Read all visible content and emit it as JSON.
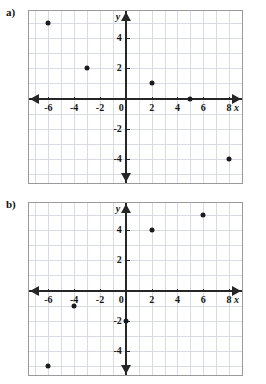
{
  "page": {
    "background_color": "#ffffff",
    "grid_color": "#d9dbe4",
    "axis_color": "#262626",
    "point_color": "#1b1b1b",
    "frame_color": "#9a9a9a"
  },
  "panels": [
    {
      "id": "a",
      "label": "a)",
      "axis_letter_x": "x",
      "axis_letter_y": "y",
      "x_tick_labels": [
        "-6",
        "-4",
        "-2",
        "0",
        "2",
        "4",
        "6",
        "8"
      ],
      "y_tick_labels": [
        "4",
        "2",
        "-2",
        "-4"
      ]
    },
    {
      "id": "b",
      "label": "b)",
      "axis_letter_x": "x",
      "axis_letter_y": "y",
      "x_tick_labels": [
        "-6",
        "-4",
        "-2",
        "0",
        "2",
        "4",
        "6",
        "8"
      ],
      "y_tick_labels": [
        "6",
        "4",
        "2",
        "-2",
        "-4"
      ]
    }
  ],
  "chart_data": [
    {
      "type": "scatter",
      "title": "a)",
      "xlabel": "x",
      "ylabel": "y",
      "xlim": [
        -7.5,
        9
      ],
      "ylim": [
        -5.6,
        5.8
      ],
      "xticks": [
        -6,
        -4,
        -2,
        0,
        2,
        4,
        6,
        8
      ],
      "yticks": [
        4,
        2,
        0,
        -2,
        -4
      ],
      "grid": true,
      "grid_step": 1,
      "legend": "none",
      "points": [
        {
          "x": -6,
          "y": 5
        },
        {
          "x": -3,
          "y": 2
        },
        {
          "x": 2,
          "y": 1
        },
        {
          "x": 5,
          "y": 0
        },
        {
          "x": 8,
          "y": -4
        }
      ]
    },
    {
      "type": "scatter",
      "title": "b)",
      "xlabel": "x",
      "ylabel": "y",
      "xlim": [
        -7.5,
        9
      ],
      "ylim": [
        -5.6,
        5.8
      ],
      "xticks": [
        -6,
        -4,
        -2,
        0,
        2,
        4,
        6,
        8
      ],
      "yticks": [
        6,
        4,
        2,
        0,
        -2,
        -4
      ],
      "grid": true,
      "grid_step": 1,
      "legend": "none",
      "points": [
        {
          "x": -6,
          "y": -5
        },
        {
          "x": -4,
          "y": -1
        },
        {
          "x": 0,
          "y": -2
        },
        {
          "x": 2,
          "y": 4
        },
        {
          "x": 6,
          "y": 5
        },
        {
          "x": 8,
          "y": 7
        }
      ]
    }
  ]
}
